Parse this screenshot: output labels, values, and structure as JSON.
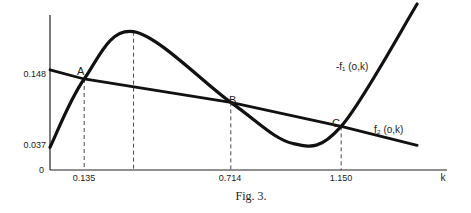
{
  "chart_data": {
    "type": "line",
    "title": "",
    "caption": "Fig. 3.",
    "xlabel": "k",
    "ylabel": "",
    "x_ticks": [
      "0.135",
      "0.714",
      "1.150"
    ],
    "y_ticks": [
      "0",
      "0.037",
      "0.148"
    ],
    "origin_label": "0",
    "series": [
      {
        "name": "-f1(o,k)",
        "label": "-f₁ (o,k)",
        "points": [
          [
            0.0,
            0.037
          ],
          [
            0.135,
            0.148
          ],
          [
            0.33,
            0.225
          ],
          [
            0.714,
            0.11
          ],
          [
            0.96,
            0.043
          ],
          [
            1.15,
            0.071
          ],
          [
            1.45,
            0.27
          ]
        ]
      },
      {
        "name": "f2(o,k)",
        "label": "f₂ (o,k)",
        "points": [
          [
            0.0,
            0.163
          ],
          [
            0.135,
            0.148
          ],
          [
            0.714,
            0.11
          ],
          [
            1.15,
            0.071
          ],
          [
            1.45,
            0.04
          ]
        ]
      }
    ],
    "annotations": [
      {
        "label": "A",
        "x": 0.135,
        "y": 0.148
      },
      {
        "label": "B",
        "x": 0.714,
        "y": 0.11
      },
      {
        "label": "C",
        "x": 1.15,
        "y": 0.071
      }
    ],
    "dashed_verticals": [
      0.135,
      0.33,
      0.714,
      1.15
    ],
    "xlim": [
      0,
      1.55
    ],
    "ylim": [
      0,
      0.3
    ],
    "grid": false
  }
}
